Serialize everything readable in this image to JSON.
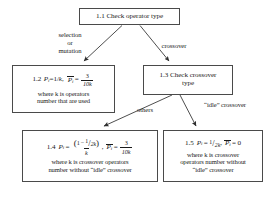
{
  "diagram": {
    "type": "flowchart",
    "nodes": [
      {
        "id": "1.1",
        "name": "check-operator-type",
        "label": "1.1 Check operator type"
      },
      {
        "id": "1.2",
        "name": "selection-mutation-probability",
        "formula_id": "1.2",
        "formula_text": "Pi=1/k,  P̄i = 3/10k",
        "p_expression": "Pi=1/k",
        "pbar_numerator": "3",
        "pbar_denominator": "10k",
        "note": "where k is operators\nnumber that are used"
      },
      {
        "id": "1.3",
        "name": "check-crossover-type",
        "label": "1.3 Check crossover\ntype"
      },
      {
        "id": "1.4",
        "name": "others-crossover-probability",
        "formula_id": "1.4",
        "formula_text": "Pi = (1 − 1/2k)/k ,  P̄i = 3/10k",
        "numerator_left": "1",
        "numerator_minus": "−",
        "numerator_frac_num": "1",
        "numerator_frac_den": "2k",
        "denominator": "k",
        "pbar_numerator": "3",
        "pbar_denominator": "10k",
        "note": "where k is crossover operators\nnumber without “idle” crossover"
      },
      {
        "id": "1.5",
        "name": "idle-crossover-probability",
        "formula_id": "1.5",
        "formula_text": "Pi = 1/2k,  P̄i = 0",
        "p_frac_num": "1",
        "p_frac_den": "2k",
        "pbar_value": "0",
        "note": "where k is crossover\noperators number without\n“idle” crossover"
      }
    ],
    "edges": [
      {
        "name": "edge-selection-mutation",
        "from": "1.1",
        "to": "1.2",
        "label": "selection\nor\nmutation"
      },
      {
        "name": "edge-crossover",
        "from": "1.1",
        "to": "1.3",
        "label": "crossover"
      },
      {
        "name": "edge-others",
        "from": "1.3",
        "to": "1.4",
        "label": "others"
      },
      {
        "name": "edge-idle-crossover",
        "from": "1.3",
        "to": "1.5",
        "label": "“idle” crossover"
      }
    ],
    "symbols": {
      "p_var": "P",
      "p_sub": "i",
      "equals": "=",
      "comma": ",",
      "slash": "/",
      "one": "1",
      "k": "k",
      "zero": "0"
    },
    "colors": {
      "box_border": "#4a4a4a",
      "text": "#1a1a1a",
      "background": "#ffffff",
      "edge_stroke": "#3a3a3a"
    }
  }
}
